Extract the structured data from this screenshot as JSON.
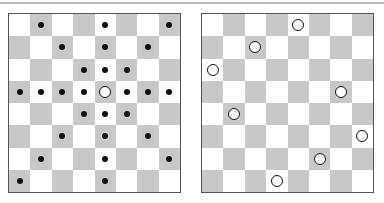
{
  "figure": {
    "size": 8,
    "colors": {
      "light": "#ffffff",
      "dark": "#c8c8c8",
      "border": "#555555",
      "marker": "#111111"
    },
    "boards": [
      {
        "name": "queen-attack-board",
        "left": 8,
        "queens": [
          [
            3,
            4
          ]
        ],
        "attacks": [
          [
            0,
            1
          ],
          [
            0,
            4
          ],
          [
            0,
            7
          ],
          [
            1,
            2
          ],
          [
            1,
            4
          ],
          [
            1,
            6
          ],
          [
            2,
            3
          ],
          [
            2,
            4
          ],
          [
            2,
            5
          ],
          [
            3,
            0
          ],
          [
            3,
            1
          ],
          [
            3,
            2
          ],
          [
            3,
            3
          ],
          [
            3,
            5
          ],
          [
            3,
            6
          ],
          [
            3,
            7
          ],
          [
            4,
            3
          ],
          [
            4,
            4
          ],
          [
            4,
            5
          ],
          [
            5,
            2
          ],
          [
            5,
            4
          ],
          [
            5,
            6
          ],
          [
            6,
            1
          ],
          [
            6,
            4
          ],
          [
            6,
            7
          ],
          [
            7,
            0
          ],
          [
            7,
            4
          ]
        ]
      },
      {
        "name": "eight-queens-solution-board",
        "left": 201,
        "queens": [
          [
            0,
            4
          ],
          [
            1,
            2
          ],
          [
            2,
            0
          ],
          [
            3,
            6
          ],
          [
            4,
            1
          ],
          [
            5,
            7
          ],
          [
            6,
            5
          ],
          [
            7,
            3
          ]
        ],
        "attacks": []
      }
    ]
  }
}
